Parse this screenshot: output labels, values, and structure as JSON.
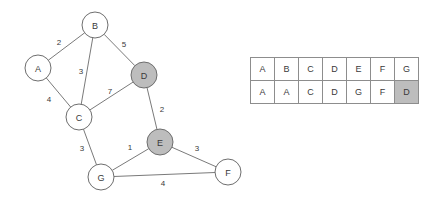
{
  "graph": {
    "node_radius": 13,
    "shaded_fill": "#bdbdbd",
    "node_fill": "#ffffff",
    "stroke_color": "#6e6e6e",
    "edge_color": "#7a7a7a",
    "nodes": [
      {
        "id": "A",
        "label": "A",
        "x": 38,
        "y": 68,
        "shaded": false
      },
      {
        "id": "B",
        "label": "B",
        "x": 95,
        "y": 25,
        "shaded": false
      },
      {
        "id": "C",
        "label": "C",
        "x": 79,
        "y": 117,
        "shaded": false
      },
      {
        "id": "D",
        "label": "D",
        "x": 144,
        "y": 75,
        "shaded": true
      },
      {
        "id": "E",
        "label": "E",
        "x": 160,
        "y": 142,
        "shaded": true
      },
      {
        "id": "F",
        "label": "F",
        "x": 228,
        "y": 172,
        "shaded": false
      },
      {
        "id": "G",
        "label": "G",
        "x": 101,
        "y": 177,
        "shaded": false
      }
    ],
    "edges": [
      {
        "from": "A",
        "to": "B",
        "weight": "2",
        "lx": 59,
        "ly": 42
      },
      {
        "from": "B",
        "to": "D",
        "weight": "5",
        "lx": 124,
        "ly": 44
      },
      {
        "from": "B",
        "to": "C",
        "weight": "3",
        "lx": 81,
        "ly": 71
      },
      {
        "from": "A",
        "to": "C",
        "weight": "4",
        "lx": 49,
        "ly": 99
      },
      {
        "from": "C",
        "to": "D",
        "weight": "7",
        "lx": 110,
        "ly": 91
      },
      {
        "from": "D",
        "to": "E",
        "weight": "2",
        "lx": 162,
        "ly": 109
      },
      {
        "from": "C",
        "to": "G",
        "weight": "3",
        "lx": 82,
        "ly": 148
      },
      {
        "from": "G",
        "to": "E",
        "weight": "1",
        "lx": 130,
        "ly": 147
      },
      {
        "from": "E",
        "to": "F",
        "weight": "3",
        "lx": 197,
        "ly": 148
      },
      {
        "from": "G",
        "to": "F",
        "weight": "4",
        "lx": 163,
        "ly": 183
      }
    ]
  },
  "table": {
    "shaded_fill": "#bdbdbd",
    "header_row": [
      "A",
      "B",
      "C",
      "D",
      "E",
      "F",
      "G"
    ],
    "value_row": [
      "A",
      "A",
      "C",
      "D",
      "G",
      "F",
      "D"
    ],
    "shaded_cells": {
      "row": 1,
      "col": 6
    }
  }
}
